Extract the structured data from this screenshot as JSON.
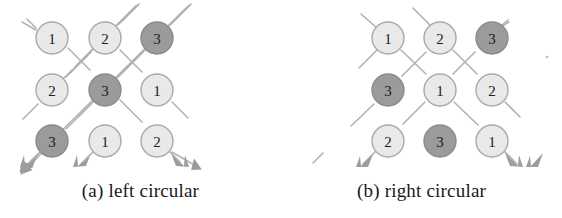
{
  "figure": {
    "width": 562,
    "height": 218,
    "background": "#ffffff",
    "style": {
      "light_fill": "#e9e9e9",
      "light_stroke": "#a9a9a9",
      "dark_fill": "#9b9b9b",
      "dark_stroke": "#8a8a8a",
      "line_color": "#b2b2b2",
      "arrow_color": "#9c9c9c",
      "label_color": "#1c1c1c",
      "caption_color": "#1a1a1a"
    },
    "geometry": {
      "radius": 16,
      "columns_a": [
        52,
        105,
        157
      ],
      "columns_b": [
        388,
        440,
        492
      ],
      "rows": [
        38,
        90,
        141
      ]
    }
  },
  "panels": [
    {
      "id": "left-circular",
      "caption": "(a) left circular",
      "grid": [
        [
          {
            "value": "1",
            "shade": "light"
          },
          {
            "value": "2",
            "shade": "light"
          },
          {
            "value": "3",
            "shade": "dark"
          }
        ],
        [
          {
            "value": "2",
            "shade": "light"
          },
          {
            "value": "3",
            "shade": "dark"
          },
          {
            "value": "1",
            "shade": "light"
          }
        ],
        [
          {
            "value": "3",
            "shade": "dark"
          },
          {
            "value": "1",
            "shade": "light"
          },
          {
            "value": "2",
            "shade": "light"
          }
        ]
      ],
      "arrow_count": 3,
      "arrow_note": "three diagonal tracks flowing down-left, each ending in an arrowhead below the bottom row"
    },
    {
      "id": "right-circular",
      "caption": "(b) right circular",
      "grid": [
        [
          {
            "value": "1",
            "shade": "light"
          },
          {
            "value": "2",
            "shade": "light"
          },
          {
            "value": "3",
            "shade": "dark"
          }
        ],
        [
          {
            "value": "3",
            "shade": "dark"
          },
          {
            "value": "1",
            "shade": "light"
          },
          {
            "value": "2",
            "shade": "light"
          }
        ],
        [
          {
            "value": "2",
            "shade": "light"
          },
          {
            "value": "3",
            "shade": "dark"
          },
          {
            "value": "1",
            "shade": "light"
          }
        ]
      ],
      "arrow_count": 3,
      "arrow_note": "three diagonal tracks flowing down-right, each ending in an arrowhead below the bottom row"
    }
  ]
}
